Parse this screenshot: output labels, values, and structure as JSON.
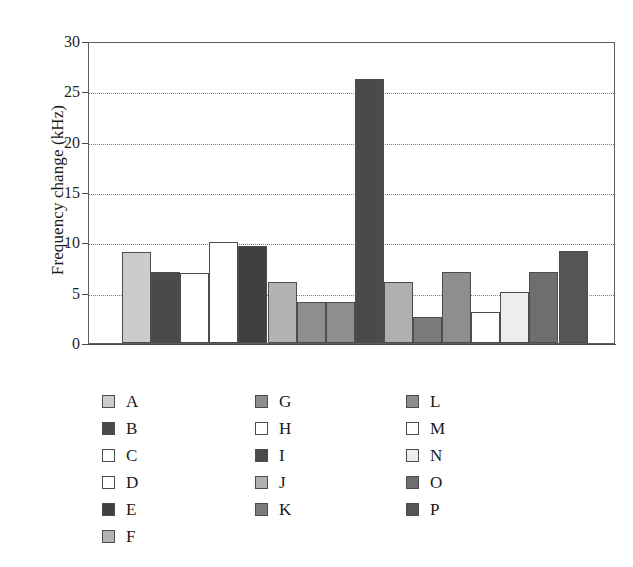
{
  "chart_data": {
    "type": "bar",
    "title": "",
    "xlabel": "",
    "ylabel": "Frequency change (kHz)",
    "ylim": [
      0,
      30
    ],
    "ytick_labels": [
      "30",
      "25",
      "20",
      "15",
      "10",
      "5",
      "0"
    ],
    "ytick_values": [
      30,
      25,
      20,
      15,
      10,
      5,
      0
    ],
    "grid": "horizontal-dotted",
    "xtick_labels": [],
    "legend_position": "below-plot-three-columns",
    "categories": [
      "A",
      "B",
      "C",
      "D",
      "E",
      "F",
      "G",
      "H",
      "I",
      "J",
      "K",
      "L",
      "M",
      "N",
      "O",
      "P"
    ],
    "values": [
      9.0,
      7.1,
      7.0,
      10.0,
      9.6,
      6.1,
      4.1,
      4.1,
      26.2,
      6.1,
      2.6,
      7.1,
      3.1,
      5.1,
      7.1,
      9.1
    ],
    "colors": [
      "#cccccc",
      "#4a4a4a",
      "#ffffff",
      "#ffffff",
      "#3f3f3f",
      "#b3b3b3",
      "#8e8e8e",
      "#8e8e8e",
      "#4a4a4a",
      "#b0b0b0",
      "#7a7a7a",
      "#8e8e8e",
      "#ffffff",
      "#ededed",
      "#6e6e6e",
      "#555555"
    ]
  },
  "legend": {
    "columns": [
      {
        "items": [
          {
            "label": "A",
            "color": "#cccccc"
          },
          {
            "label": "B",
            "color": "#4a4a4a"
          },
          {
            "label": "C",
            "color": "#ffffff"
          },
          {
            "label": "D",
            "color": "#ffffff"
          },
          {
            "label": "E",
            "color": "#3f3f3f"
          },
          {
            "label": "F",
            "color": "#b3b3b3"
          }
        ]
      },
      {
        "items": [
          {
            "label": "G",
            "color": "#8e8e8e"
          },
          {
            "label": "H",
            "color": "#ffffff"
          },
          {
            "label": "I",
            "color": "#4a4a4a"
          },
          {
            "label": "J",
            "color": "#b0b0b0"
          },
          {
            "label": "K",
            "color": "#7a7a7a"
          }
        ]
      },
      {
        "items": [
          {
            "label": "L",
            "color": "#8e8e8e"
          },
          {
            "label": "M",
            "color": "#ffffff"
          },
          {
            "label": "N",
            "color": "#ededed"
          },
          {
            "label": "O",
            "color": "#6e6e6e"
          },
          {
            "label": "P",
            "color": "#555555"
          }
        ]
      }
    ]
  }
}
